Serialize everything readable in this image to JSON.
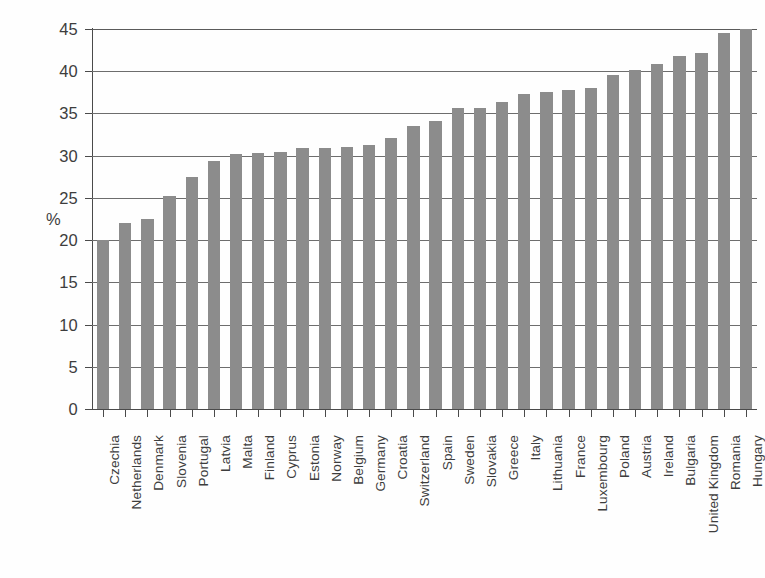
{
  "chart_data": {
    "type": "bar",
    "title": "",
    "xlabel": "",
    "ylabel": "%",
    "ylim": [
      0,
      45
    ],
    "ytick_labels": [
      "0",
      "5",
      "10",
      "15",
      "20",
      "25",
      "30",
      "35",
      "40",
      "45"
    ],
    "ytick_values": [
      0,
      5,
      10,
      15,
      20,
      25,
      30,
      35,
      40,
      45
    ],
    "grid": "horizontal",
    "legend": "none",
    "bar_color": "#8c8c8c",
    "categories": [
      "Czechia",
      "Netherlands",
      "Denmark",
      "Slovenia",
      "Portugal",
      "Latvia",
      "Malta",
      "Finland",
      "Cyprus",
      "Estonia",
      "Norway",
      "Belgium",
      "Germany",
      "Croatia",
      "Switzerland",
      "Spain",
      "Sweden",
      "Slovakia",
      "Greece",
      "Italy",
      "Lithuania",
      "France",
      "Luxembourg",
      "Poland",
      "Austria",
      "Ireland",
      "Bulgaria",
      "United Kingdom",
      "Romania",
      "Hungary"
    ],
    "values": [
      20.0,
      22.0,
      22.5,
      25.2,
      27.5,
      29.4,
      30.2,
      30.3,
      30.4,
      30.9,
      30.9,
      31.0,
      31.3,
      32.1,
      33.5,
      34.1,
      35.6,
      35.7,
      36.3,
      37.3,
      37.5,
      37.8,
      38.0,
      39.6,
      40.2,
      40.8,
      41.8,
      42.2,
      44.5,
      45.0
    ]
  }
}
